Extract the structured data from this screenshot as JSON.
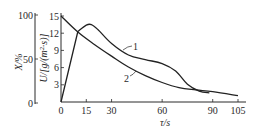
{
  "chart_data": {
    "type": "line",
    "title": "",
    "xlabel": "τ/s",
    "ylabel": "U/[g/(m²·s)]",
    "ylabel_secondary": "X/%",
    "xlim": [
      0,
      105
    ],
    "ylim": [
      0,
      15
    ],
    "ylim_secondary": [
      0,
      100
    ],
    "x_ticks": [
      "0",
      "15",
      "30",
      "60",
      "90",
      "105"
    ],
    "x_tick_values": [
      0,
      15,
      30,
      60,
      90,
      105
    ],
    "y_ticks": [
      "3",
      "6",
      "9",
      "12",
      "15"
    ],
    "y_tick_values": [
      3,
      6,
      9,
      12,
      15
    ],
    "y_secondary_ticks": [
      "0",
      "50",
      "100"
    ],
    "y_secondary_tick_values": [
      0,
      50,
      100
    ],
    "grid": false,
    "legend": "inline-labels",
    "series": [
      {
        "name": "1",
        "x": [
          0,
          10,
          15,
          18,
          22,
          30,
          40,
          50,
          60,
          68,
          75,
          82,
          88
        ],
        "values": [
          0,
          12.3,
          13.4,
          13.5,
          12.6,
          10.2,
          8.2,
          7.4,
          6.7,
          5.4,
          3.1,
          1.9,
          1.6
        ]
      },
      {
        "name": "2",
        "x": [
          0,
          10,
          20,
          30,
          40,
          50,
          60,
          70,
          80,
          90,
          105
        ],
        "values": [
          15,
          12.2,
          10.0,
          8.0,
          6.1,
          4.6,
          3.4,
          2.5,
          2.1,
          1.8,
          1.1
        ]
      }
    ]
  }
}
